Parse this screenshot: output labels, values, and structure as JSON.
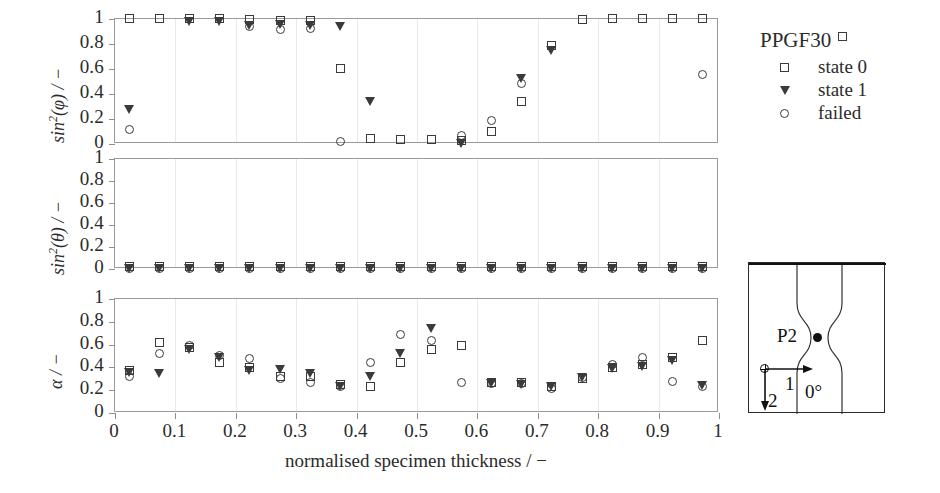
{
  "figure": {
    "xaxis_title": "normalised specimen thickness / −",
    "xticks": [
      "0",
      "0.1",
      "0.2",
      "0.3",
      "0.4",
      "0.5",
      "0.6",
      "0.7",
      "0.8",
      "0.9",
      "1"
    ],
    "xtick_values": [
      0,
      0.1,
      0.2,
      0.3,
      0.4,
      0.5,
      0.6,
      0.7,
      0.8,
      0.9,
      1
    ],
    "yticks": [
      "0",
      "0.2",
      "0.4",
      "0.6",
      "0.8",
      "1"
    ],
    "ytick_values": [
      0,
      0.2,
      0.4,
      0.6,
      0.8,
      1
    ]
  },
  "legend": {
    "title": "PPGF30",
    "title_marker": "square",
    "entries": [
      {
        "marker": "square",
        "label": "state 0"
      },
      {
        "marker": "triangle",
        "label": "state 1"
      },
      {
        "marker": "circle",
        "label": "failed"
      }
    ]
  },
  "inset": {
    "point_label": "P2",
    "angle_label": "0°",
    "axis1_label": "1",
    "axis2_label": "2"
  },
  "chart_data": [
    {
      "type": "scatter",
      "panel": "top",
      "title": "",
      "xlabel": "normalised specimen thickness / −",
      "ylabel": "sin2(phi) / −",
      "ylabel_display": "sin²(φ) / −",
      "xlim": [
        0,
        1
      ],
      "ylim": [
        0,
        1
      ],
      "grid": true,
      "x": [
        0.025,
        0.075,
        0.125,
        0.175,
        0.225,
        0.275,
        0.325,
        0.375,
        0.425,
        0.475,
        0.525,
        0.575,
        0.625,
        0.675,
        0.725,
        0.775,
        0.825,
        0.875,
        0.925,
        0.975
      ],
      "series": [
        {
          "name": "state 0",
          "marker": "square",
          "values": [
            1.0,
            1.0,
            1.0,
            1.0,
            0.99,
            0.98,
            0.98,
            0.6,
            0.04,
            0.03,
            0.03,
            0.02,
            0.09,
            0.33,
            0.78,
            0.99,
            1.0,
            1.0,
            1.0,
            1.0
          ]
        },
        {
          "name": "state 1",
          "marker": "triangle",
          "values": [
            0.27,
            null,
            0.97,
            0.97,
            0.94,
            0.95,
            0.94,
            0.93,
            0.33,
            null,
            null,
            0.0,
            null,
            0.52,
            0.74,
            null,
            null,
            null,
            null,
            null
          ]
        },
        {
          "name": "failed",
          "marker": "circle",
          "values": [
            0.11,
            null,
            null,
            null,
            0.93,
            0.91,
            0.92,
            0.01,
            null,
            null,
            null,
            0.06,
            0.18,
            0.48,
            null,
            null,
            null,
            null,
            null,
            0.55
          ]
        }
      ]
    },
    {
      "type": "scatter",
      "panel": "middle",
      "title": "",
      "xlabel": "normalised specimen thickness / −",
      "ylabel": "sin2(theta) / −",
      "ylabel_display": "sin²(θ) / −",
      "xlim": [
        0,
        1
      ],
      "ylim": [
        0,
        1
      ],
      "grid": true,
      "x": [
        0.025,
        0.075,
        0.125,
        0.175,
        0.225,
        0.275,
        0.325,
        0.375,
        0.425,
        0.475,
        0.525,
        0.575,
        0.625,
        0.675,
        0.725,
        0.775,
        0.825,
        0.875,
        0.925,
        0.975
      ],
      "series": [
        {
          "name": "state 0",
          "marker": "square",
          "values": [
            0.01,
            0.01,
            0.01,
            0.01,
            0.01,
            0.01,
            0.01,
            0.01,
            0.01,
            0.01,
            0.01,
            0.01,
            0.01,
            0.01,
            0.01,
            0.01,
            0.01,
            0.01,
            0.01,
            0.01
          ]
        },
        {
          "name": "state 1",
          "marker": "triangle",
          "values": [
            0.0,
            0.0,
            0.0,
            0.0,
            0.0,
            0.0,
            0.0,
            0.0,
            0.0,
            0.0,
            0.0,
            0.0,
            0.0,
            0.0,
            0.0,
            0.0,
            0.0,
            0.0,
            0.0,
            0.0
          ]
        },
        {
          "name": "failed",
          "marker": "circle",
          "values": [
            0.0,
            0.0,
            0.0,
            0.0,
            0.0,
            0.0,
            0.0,
            0.0,
            0.0,
            0.0,
            0.0,
            0.0,
            0.0,
            0.0,
            0.0,
            0.0,
            0.0,
            0.0,
            0.0,
            0.0
          ]
        }
      ]
    },
    {
      "type": "scatter",
      "panel": "bottom",
      "title": "",
      "xlabel": "normalised specimen thickness / −",
      "ylabel": "alpha / −",
      "ylabel_display": "α / −",
      "xlim": [
        0,
        1
      ],
      "ylim": [
        0,
        1
      ],
      "grid": true,
      "x": [
        0.025,
        0.075,
        0.125,
        0.175,
        0.225,
        0.275,
        0.325,
        0.375,
        0.425,
        0.475,
        0.525,
        0.575,
        0.625,
        0.675,
        0.725,
        0.775,
        0.825,
        0.875,
        0.925,
        0.975
      ],
      "series": [
        {
          "name": "state 0",
          "marker": "square",
          "values": [
            0.36,
            0.61,
            0.57,
            0.43,
            0.39,
            0.31,
            0.31,
            0.24,
            0.22,
            0.43,
            0.55,
            0.58,
            0.26,
            0.26,
            0.22,
            0.29,
            0.39,
            0.42,
            0.48,
            0.63
          ]
        },
        {
          "name": "state 1",
          "marker": "triangle",
          "values": [
            0.35,
            0.34,
            0.55,
            0.48,
            0.36,
            0.37,
            0.34,
            0.22,
            0.31,
            0.51,
            0.73,
            null,
            0.25,
            0.24,
            0.22,
            0.3,
            0.38,
            0.4,
            0.45,
            0.23
          ]
        },
        {
          "name": "failed",
          "marker": "circle",
          "values": [
            0.31,
            0.51,
            0.58,
            0.5,
            0.47,
            0.29,
            0.26,
            0.22,
            0.43,
            0.68,
            0.63,
            0.26,
            0.25,
            0.25,
            0.21,
            0.3,
            0.42,
            0.48,
            0.27,
            0.22
          ]
        }
      ]
    }
  ]
}
